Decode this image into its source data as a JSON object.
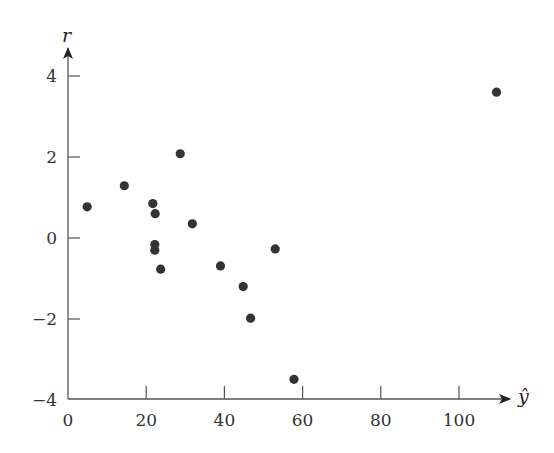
{
  "chart_data": {
    "type": "scatter",
    "title": "",
    "xlabel": "ŷ",
    "ylabel": "r",
    "xlim": [
      0,
      113
    ],
    "ylim": [
      -4,
      4.7
    ],
    "grid": false,
    "legend": null,
    "x_ticks": [
      0,
      20,
      40,
      60,
      80,
      100
    ],
    "x_tick_labels": [
      "0",
      "20",
      "40",
      "60",
      "80",
      "100"
    ],
    "y_ticks": [
      -4,
      -2,
      0,
      2,
      4
    ],
    "y_tick_labels": [
      "−4",
      "−2",
      "0",
      "2",
      "4"
    ],
    "point_color": "#333333",
    "axis_color": "#555555",
    "series": [
      {
        "name": "residuals",
        "points": [
          {
            "x": 4.9,
            "y": 0.77
          },
          {
            "x": 14.4,
            "y": 1.29
          },
          {
            "x": 21.7,
            "y": 0.85
          },
          {
            "x": 22.3,
            "y": 0.6
          },
          {
            "x": 22.2,
            "y": -0.16
          },
          {
            "x": 22.2,
            "y": -0.3
          },
          {
            "x": 23.7,
            "y": -0.77
          },
          {
            "x": 28.7,
            "y": 2.08
          },
          {
            "x": 31.8,
            "y": 0.35
          },
          {
            "x": 39.0,
            "y": -0.69
          },
          {
            "x": 44.8,
            "y": -1.2
          },
          {
            "x": 46.7,
            "y": -1.98
          },
          {
            "x": 53.0,
            "y": -0.27
          },
          {
            "x": 57.8,
            "y": -3.49
          },
          {
            "x": 109.6,
            "y": 3.6
          }
        ]
      }
    ]
  }
}
